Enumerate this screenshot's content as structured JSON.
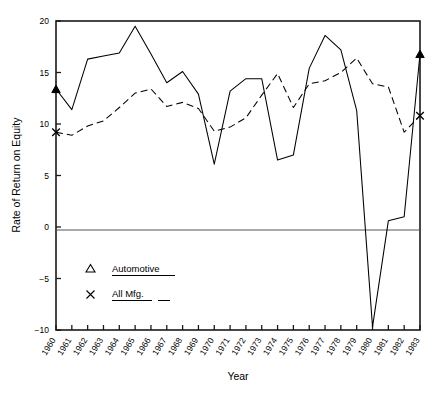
{
  "chart_data": {
    "type": "line",
    "title": "",
    "xlabel": "Year",
    "ylabel": "Rate of Return on Equity",
    "xlim": [
      1960,
      1983
    ],
    "ylim": [
      -10,
      20
    ],
    "yticks": [
      -10,
      -5,
      0,
      5,
      10,
      15,
      20
    ],
    "ytick_labels": [
      "-10",
      "-5",
      "0",
      "5",
      "10",
      "15",
      "20"
    ],
    "grid": false,
    "zero_line": true,
    "legend_position": "lower-left",
    "categories": [
      1960,
      1961,
      1962,
      1963,
      1964,
      1965,
      1966,
      1967,
      1968,
      1969,
      1970,
      1971,
      1972,
      1973,
      1974,
      1975,
      1976,
      1977,
      1978,
      1979,
      1980,
      1981,
      1982,
      1983
    ],
    "xtick_labels": [
      "1960",
      "1961",
      "1962",
      "1963",
      "1964",
      "1965",
      "1966",
      "1967",
      "1968",
      "1969",
      "1970",
      "1971",
      "1972",
      "1973",
      "1974",
      "1975",
      "1976",
      "1977",
      "1978",
      "1979",
      "1980",
      "1981",
      "1982",
      "1983"
    ],
    "series": [
      {
        "name": "Automotive",
        "marker": "triangle",
        "line_style": "solid",
        "color": "#000000",
        "values": [
          13.4,
          11.4,
          16.3,
          16.6,
          16.9,
          19.5,
          16.8,
          14.0,
          15.1,
          12.9,
          6.1,
          13.2,
          14.4,
          14.4,
          6.5,
          7.0,
          15.4,
          18.6,
          17.2,
          11.3,
          -9.7,
          0.6,
          1.0,
          16.8
        ]
      },
      {
        "name": "All Mfg.",
        "marker": "x",
        "line_style": "dashed",
        "color": "#000000",
        "values": [
          9.2,
          8.9,
          9.8,
          10.3,
          11.6,
          13.0,
          13.4,
          11.7,
          12.1,
          11.5,
          9.3,
          9.7,
          10.6,
          12.8,
          14.9,
          11.6,
          13.9,
          14.2,
          15.0,
          16.4,
          13.9,
          13.6,
          9.2,
          10.8
        ]
      }
    ],
    "annotations": []
  },
  "legend": {
    "items": [
      {
        "symbol": "△",
        "label": "Automotive"
      },
      {
        "symbol": "×",
        "label": "All Mfg."
      }
    ]
  },
  "axes": {
    "y_title": "Rate of Return on Equity",
    "x_title": "Year"
  }
}
